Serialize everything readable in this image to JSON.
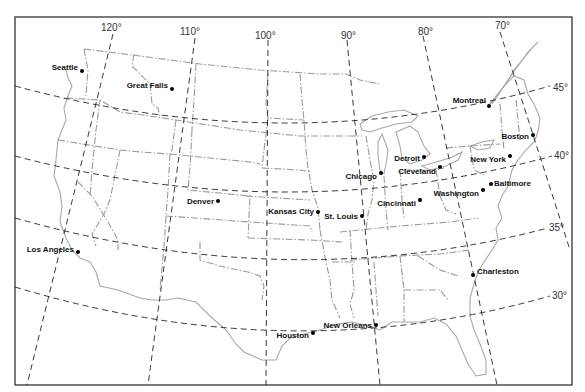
{
  "map": {
    "title": "United States map with latitude and longitude grid",
    "meridians": [
      {
        "label": "120°",
        "x_top": 113,
        "x_bottom": 27
      },
      {
        "label": "110°",
        "x_top": 195,
        "x_bottom": 148
      },
      {
        "label": "100°",
        "x_top": 268,
        "x_bottom": 266
      },
      {
        "label": "90°",
        "x_top": 347,
        "x_bottom": 380
      },
      {
        "label": "80°",
        "x_top": 423,
        "x_bottom": 497
      },
      {
        "label": "70°",
        "x_top": 500,
        "x_bottom": 570
      }
    ],
    "parallels": [
      {
        "label": "45°"
      },
      {
        "label": "40°"
      },
      {
        "label": "35°"
      },
      {
        "label": "30°"
      }
    ],
    "cities": [
      {
        "name": "Seattle",
        "x": 82,
        "y": 71
      },
      {
        "name": "Great Falls",
        "x": 172,
        "y": 89
      },
      {
        "name": "Montreal",
        "x": 489,
        "y": 106
      },
      {
        "name": "Boston",
        "x": 533,
        "y": 135
      },
      {
        "name": "Detroit",
        "x": 424,
        "y": 157
      },
      {
        "name": "New York",
        "x": 510,
        "y": 156
      },
      {
        "name": "Cleveland",
        "x": 440,
        "y": 167
      },
      {
        "name": "Chicago",
        "x": 381,
        "y": 173
      },
      {
        "name": "Baltimore",
        "x": 491,
        "y": 184
      },
      {
        "name": "Washington",
        "x": 483,
        "y": 190
      },
      {
        "name": "Cincinnati",
        "x": 420,
        "y": 200
      },
      {
        "name": "Denver",
        "x": 218,
        "y": 201
      },
      {
        "name": "Kansas City",
        "x": 318,
        "y": 212
      },
      {
        "name": "St. Louis",
        "x": 362,
        "y": 216
      },
      {
        "name": "Los Angeles",
        "x": 78,
        "y": 252
      },
      {
        "name": "Charleston",
        "x": 473,
        "y": 275
      },
      {
        "name": "New Orleans",
        "x": 376,
        "y": 325
      },
      {
        "name": "Houston",
        "x": 313,
        "y": 333
      }
    ]
  }
}
